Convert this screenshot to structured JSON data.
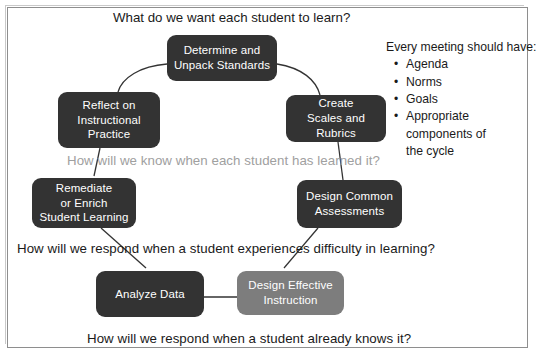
{
  "diagram": {
    "title": "What do we want each student to learn?",
    "questions": [
      {
        "text": "How will we know when each student has learned it?",
        "style": "muted"
      },
      {
        "text": "How will we respond when a student experiences difficulty in learning?",
        "style": "normal"
      },
      {
        "text": "How will we respond when a student already knows it?",
        "style": "normal"
      }
    ],
    "nodes": [
      {
        "id": "determine-and-unpack-standards",
        "label": "Determine and\nUnpack Standards",
        "shade": "dark"
      },
      {
        "id": "create-scales-and-rubrics",
        "label": "Create\nScales and Rubrics",
        "shade": "dark"
      },
      {
        "id": "design-common-assessments",
        "label": "Design Common\nAssessments",
        "shade": "dark"
      },
      {
        "id": "design-effective-instruction",
        "label": "Design Effective\nInstruction",
        "shade": "gray"
      },
      {
        "id": "analyze-data",
        "label": "Analyze Data",
        "shade": "dark"
      },
      {
        "id": "remediate-or-enrich-student-learning",
        "label": "Remediate\nor Enrich\nStudent Learning",
        "shade": "dark"
      },
      {
        "id": "reflect-on-instructional-practice",
        "label": "Reflect on\nInstructional\nPractice",
        "shade": "dark"
      }
    ],
    "note": {
      "heading": "Every meeting should have:",
      "bullet_glyph": "•",
      "items": [
        "Agenda",
        "Norms",
        "Goals",
        "Appropriate\ncomponents of\nthe cycle"
      ]
    },
    "colors": {
      "node_dark": "#333333",
      "node_gray": "#7d7d7d",
      "text_on_node": "#ffffff",
      "muted_question": "#a0a0a0",
      "frame": "#8e8e8e",
      "connector": "#333333"
    }
  }
}
